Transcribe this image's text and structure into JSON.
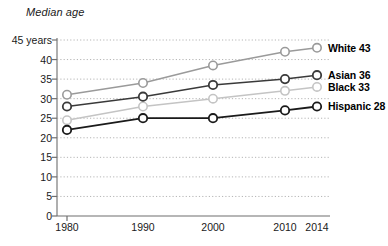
{
  "chart_data": {
    "type": "line",
    "title": "Median age",
    "xlabel": "",
    "ylabel": "Median age",
    "x": [
      1980,
      1990,
      2000,
      2010,
      2014
    ],
    "categories": [
      "1980",
      "1990",
      "2000",
      "2010",
      "2014"
    ],
    "ylim": [
      0,
      45
    ],
    "xlim": [
      1980,
      2014
    ],
    "yticks": [
      0,
      5,
      10,
      15,
      20,
      25,
      30,
      35,
      40,
      45
    ],
    "ytick_labels": [
      "0",
      "5",
      "10",
      "15",
      "20",
      "25",
      "30",
      "35",
      "40",
      "45 years"
    ],
    "xtick_labels": [
      "1980",
      "1990",
      "2000",
      "2010",
      "2014"
    ],
    "grid": "horizontal-dotted",
    "legend_position": "right-inline-end-of-line",
    "series": [
      {
        "name": "White",
        "end_label": "White 43",
        "end_value": 43,
        "color": "#9a9a9a",
        "values": [
          31,
          34,
          38.5,
          42,
          43
        ]
      },
      {
        "name": "Asian",
        "end_label": "Asian 36",
        "end_value": 36,
        "color": "#3a3a3a",
        "values": [
          28,
          30.5,
          33.5,
          35,
          36
        ]
      },
      {
        "name": "Black",
        "end_label": "Black 33",
        "end_value": 33,
        "color": "#c4c4c4",
        "values": [
          24.5,
          28,
          30,
          32,
          33
        ]
      },
      {
        "name": "Hispanic",
        "end_label": "Hispanic 28",
        "end_value": 28,
        "color": "#1a1a1a",
        "values": [
          22,
          25,
          25,
          27,
          28
        ]
      }
    ]
  },
  "colors": {
    "axis": "#8c8c8c",
    "grid": "#b5b5b5",
    "text": "#1a1a1a",
    "marker_fill": "#ffffff"
  }
}
